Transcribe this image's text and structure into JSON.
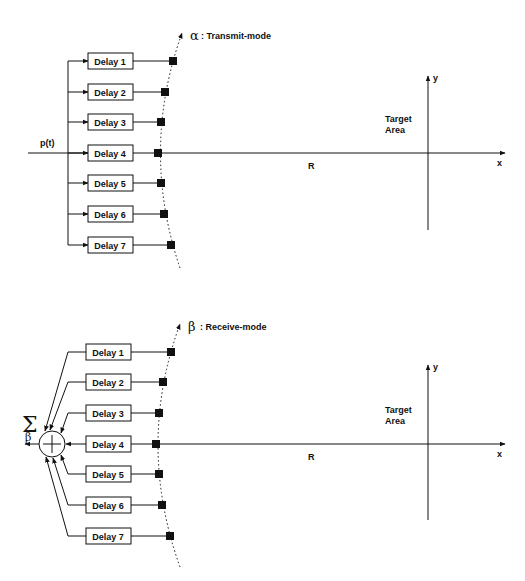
{
  "transmit": {
    "input_label": "p(t)",
    "mode_symbol": "α",
    "mode_label": ": Transmit-mode",
    "delays": [
      "Delay 1",
      "Delay 2",
      "Delay 3",
      "Delay 4",
      "Delay 5",
      "Delay 6",
      "Delay 7"
    ],
    "range_label": "R",
    "target_label_1": "Target",
    "target_label_2": "Area",
    "x_axis": "x",
    "y_axis": "y"
  },
  "receive": {
    "sum_symbol": "Σ",
    "output_symbol": "β",
    "mode_symbol": "β",
    "mode_label": ": Receive-mode",
    "delays": [
      "Delay 1",
      "Delay 2",
      "Delay 3",
      "Delay 4",
      "Delay 5",
      "Delay 6",
      "Delay 7"
    ],
    "range_label": "R",
    "target_label_1": "Target",
    "target_label_2": "Area",
    "x_axis": "x",
    "y_axis": "y"
  },
  "colors": {
    "ink": "#111111",
    "background": "#ffffff"
  }
}
